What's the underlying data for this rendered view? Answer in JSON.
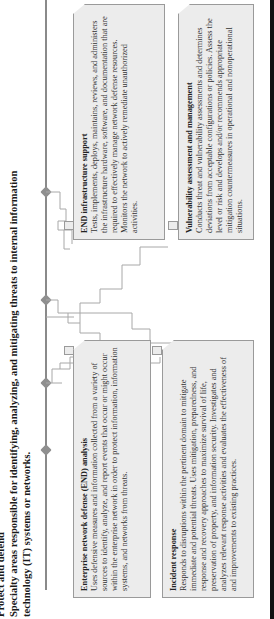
{
  "header": {
    "title": "Protect and defend",
    "subtitle_line1": "Specialty areas responsible for identifying, analyzing, and mitigating threats to internal information",
    "subtitle_line2": "technology (IT) systems or networks."
  },
  "boxes": [
    {
      "id": "end-analysis",
      "title": "Enterprise network defense (END) analysis",
      "text": "Uses defensive measures and information collected from a variety of sources to identify, analyze, and report events that occur or might occur within the enterprise network in order to protect information, information systems, and networks from threats."
    },
    {
      "id": "incident-response",
      "title": "Incident response",
      "text": "Responds to disruptions within the pertinent domain to mitigate immediate and potential threats. Uses mitigation, preparedness, and response and recovery approaches to maximize survival of life, preservation of property, and information security. Investigates and analyzes relevant response activities and evaluates the effectiveness of and improvements to existing practices."
    },
    {
      "id": "end-infrastructure-support",
      "title": "END infrastructure support",
      "text": "Tests, implements, deploys, maintains, reviews, and administers the infrastructure hardware, software, and documentation that are required to effectively manage network defense resources. Monitors the network to actively remediate unauthorized activities."
    },
    {
      "id": "vulnerability-assessment",
      "title": "Vulnerability assessment and management",
      "text": "Conducts threat and vulnerability assessments and determines deviations from acceptable configurations or policies. Assess the level or risk and develops and/or recommends appropriate mitigation countermeasures in operational and nonoperational situations."
    }
  ],
  "colors": {
    "box_fill": "#ececec",
    "box_border": "#9a9a9a",
    "spine": "#8a8a8a",
    "node": "#8f8f8f",
    "connector": "#a8a8a8"
  }
}
